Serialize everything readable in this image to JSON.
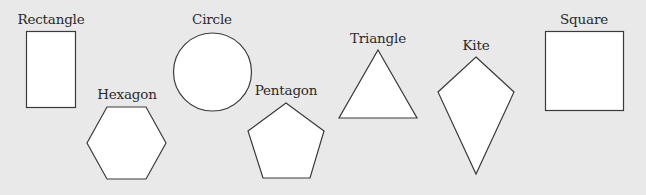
{
  "background_color": "#e9e9e9",
  "shape_fill": "#ffffff",
  "shape_stroke": "#3a3a3a",
  "shapes": [
    {
      "name": "rectangle",
      "label": "Rectangle",
      "label_pos": [
        51,
        13
      ]
    },
    {
      "name": "circle",
      "label": "Circle",
      "label_pos": [
        212,
        13
      ]
    },
    {
      "name": "hexagon",
      "label": "Hexagon",
      "label_pos": [
        127,
        88
      ]
    },
    {
      "name": "pentagon",
      "label": "Pentagon",
      "label_pos": [
        286,
        84
      ]
    },
    {
      "name": "triangle",
      "label": "Triangle",
      "label_pos": [
        378,
        32
      ]
    },
    {
      "name": "kite",
      "label": "Kite",
      "label_pos": [
        476,
        39
      ]
    },
    {
      "name": "square",
      "label": "Square",
      "label_pos": [
        584,
        13
      ]
    }
  ]
}
